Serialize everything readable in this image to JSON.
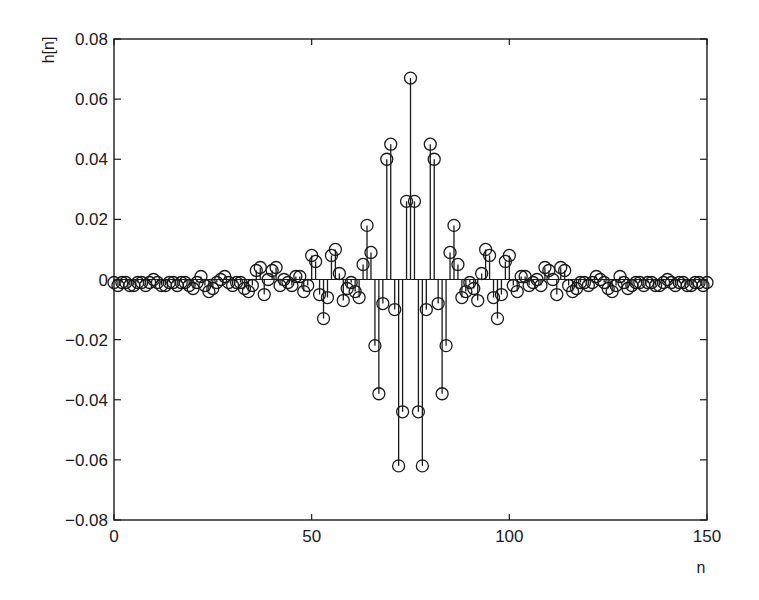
{
  "chart_data": {
    "type": "stem",
    "title": "",
    "xlabel": "n",
    "ylabel": "h[n]",
    "xlim": [
      0,
      150
    ],
    "ylim": [
      -0.08,
      0.08
    ],
    "xticks": [
      0,
      50,
      100,
      150
    ],
    "xtick_labels": [
      "0",
      "50",
      "100",
      "150"
    ],
    "yticks": [
      0.08,
      0.06,
      0.04,
      0.02,
      0,
      -0.02,
      -0.04,
      -0.06,
      -0.08
    ],
    "ytick_labels": [
      "0.08",
      "0.06",
      "0.04",
      "0.02",
      "0",
      "−0.02",
      "−0.04",
      "−0.06",
      "−0.08"
    ],
    "grid": false,
    "legend": null,
    "marker": "open-circle",
    "colors": {
      "stem": "#1a1a1a",
      "axes": "#1a1a1a",
      "background": "#ffffff"
    },
    "series": [
      {
        "name": "h[n]",
        "x_start": 0,
        "x_step": 1,
        "values": [
          -0.001,
          -0.002,
          -0.001,
          -0.001,
          -0.002,
          -0.002,
          -0.001,
          -0.001,
          -0.002,
          -0.001,
          0.0,
          -0.001,
          -0.002,
          -0.002,
          -0.001,
          -0.001,
          -0.002,
          -0.001,
          -0.001,
          -0.002,
          -0.003,
          -0.001,
          0.001,
          -0.002,
          -0.004,
          -0.003,
          -0.001,
          0.0,
          0.001,
          -0.001,
          -0.002,
          -0.001,
          -0.001,
          -0.003,
          -0.004,
          -0.002,
          0.003,
          0.004,
          -0.005,
          0.0,
          0.003,
          0.004,
          -0.002,
          0.0,
          -0.001,
          -0.002,
          0.001,
          0.001,
          -0.004,
          -0.002,
          0.008,
          0.006,
          -0.005,
          -0.013,
          -0.006,
          0.008,
          0.01,
          0.002,
          -0.007,
          -0.003,
          -0.001,
          -0.004,
          -0.006,
          0.005,
          0.018,
          0.009,
          -0.022,
          -0.038,
          -0.008,
          0.04,
          0.045,
          -0.01,
          -0.062,
          -0.044,
          0.026,
          0.067,
          0.026,
          -0.044,
          -0.062,
          -0.01,
          0.045,
          0.04,
          -0.008,
          -0.038,
          -0.022,
          0.009,
          0.018,
          0.005,
          -0.006,
          -0.004,
          -0.001,
          -0.003,
          -0.007,
          0.002,
          0.01,
          0.008,
          -0.006,
          -0.013,
          -0.005,
          0.006,
          0.008,
          -0.002,
          -0.004,
          0.001,
          0.001,
          -0.002,
          -0.001,
          0.0,
          -0.002,
          0.004,
          0.003,
          0.0,
          -0.005,
          0.004,
          0.003,
          -0.002,
          -0.004,
          -0.003,
          -0.001,
          -0.001,
          -0.002,
          -0.001,
          0.001,
          0.0,
          -0.001,
          -0.003,
          -0.004,
          -0.002,
          0.001,
          -0.001,
          -0.003,
          -0.002,
          -0.001,
          -0.001,
          -0.002,
          -0.001,
          -0.001,
          -0.002,
          -0.002,
          -0.001,
          0.0,
          -0.001,
          -0.002,
          -0.001,
          -0.001,
          -0.002,
          -0.002,
          -0.001,
          -0.001,
          -0.002,
          -0.001
        ]
      }
    ]
  }
}
